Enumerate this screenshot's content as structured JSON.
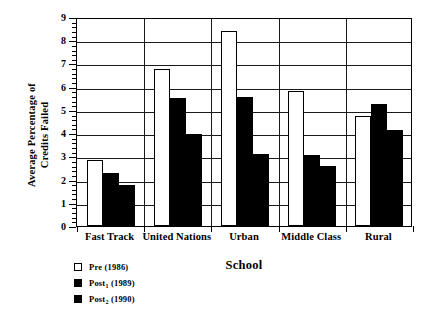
{
  "chart_data": {
    "type": "bar",
    "title": "",
    "xlabel": "School",
    "ylabel": "Average Percentage of\nCredits Failed",
    "categories": [
      "Fast Track",
      "United Nations",
      "Urban",
      "Middle Class",
      "Rural"
    ],
    "series": [
      {
        "name": "Pre (1986)",
        "key": "pre",
        "color": "#ffffff",
        "values": [
          2.85,
          6.75,
          8.4,
          5.8,
          4.75
        ]
      },
      {
        "name": "Post1 (1989)",
        "key": "post1",
        "color": "#000000",
        "values": [
          2.3,
          5.5,
          5.55,
          3.05,
          5.25
        ]
      },
      {
        "name": "Post2 (1990)",
        "key": "post2",
        "color": "#000000",
        "values": [
          1.75,
          3.95,
          3.1,
          2.6,
          4.15
        ]
      }
    ],
    "legend": [
      {
        "label": "Pre (1986)",
        "base": "Pre",
        "sub": "",
        "suffix": " (1986)",
        "swatch": "white"
      },
      {
        "label": "Post1 (1989)",
        "base": "Post",
        "sub": "1",
        "suffix": " (1989)",
        "swatch": "black"
      },
      {
        "label": "Post2 (1990)",
        "base": "Post",
        "sub": "2",
        "suffix": " (1990)",
        "swatch": "black"
      }
    ],
    "legend_position": "below-left",
    "ylim": [
      0,
      9
    ],
    "yticks": [
      0,
      1,
      2,
      3,
      4,
      5,
      6,
      7,
      8,
      9
    ],
    "ytick_labels": [
      "0",
      "1",
      "2",
      "3",
      "4",
      "5",
      "6",
      "7",
      "8",
      "9"
    ],
    "y_minor_interval": 0.2,
    "grid": "horizontal-major",
    "group_separators": true,
    "axis_color": "#000000",
    "background": "#ffffff"
  }
}
